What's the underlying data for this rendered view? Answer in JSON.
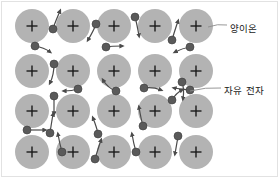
{
  "figure": {
    "title_visible": false,
    "background_color": "#ffffff",
    "border_color": "#e2e2e2",
    "width": 280,
    "height": 179
  },
  "colors": {
    "ion_fill": "#b3b3b3",
    "ion_plus": "#1a1a1a",
    "electron_fill": "#5a5a5a",
    "electron_stroke": "#3d3d3d",
    "arrow": "#4a4a4a",
    "leader_line": "#8c8c8c",
    "label_text": "#1a1a1a"
  },
  "labels": [
    {
      "id": "cation",
      "text": "양이온",
      "leader_from": [
        208,
        27
      ],
      "leader_to": [
        227,
        25
      ],
      "text_x": 230,
      "text_y": 21
    },
    {
      "id": "electron",
      "text": "자유 전자",
      "leader_from": [
        190,
        91
      ],
      "leader_to": [
        221,
        88
      ],
      "text_x": 224,
      "text_y": 83
    }
  ],
  "ion": {
    "symbol": "+",
    "radius": 17,
    "rows": 4,
    "cols": 5
  },
  "ions": [
    {
      "cx": 32,
      "cy": 26
    },
    {
      "cx": 73,
      "cy": 26
    },
    {
      "cx": 114,
      "cy": 26
    },
    {
      "cx": 155,
      "cy": 26
    },
    {
      "cx": 196,
      "cy": 26
    },
    {
      "cx": 32,
      "cy": 71
    },
    {
      "cx": 73,
      "cy": 71
    },
    {
      "cx": 114,
      "cy": 71
    },
    {
      "cx": 155,
      "cy": 71
    },
    {
      "cx": 196,
      "cy": 71
    },
    {
      "cx": 32,
      "cy": 111
    },
    {
      "cx": 73,
      "cy": 111
    },
    {
      "cx": 114,
      "cy": 111
    },
    {
      "cx": 155,
      "cy": 111
    },
    {
      "cx": 196,
      "cy": 111
    },
    {
      "cx": 32,
      "cy": 152
    },
    {
      "cx": 73,
      "cy": 152
    },
    {
      "cx": 114,
      "cy": 152
    },
    {
      "cx": 155,
      "cy": 152
    },
    {
      "cx": 196,
      "cy": 152
    }
  ],
  "electrons": [
    {
      "cx": 53,
      "cy": 29,
      "r": 4.0,
      "path": "M 53 29 C 55 22 58 16 60 11",
      "head": [
        60,
        11
      ]
    },
    {
      "cx": 96,
      "cy": 24,
      "r": 4.0,
      "path": "M 96 24 C 94 30 91 35 88 40",
      "head": [
        88,
        40
      ]
    },
    {
      "cx": 135,
      "cy": 17,
      "r": 4.0,
      "path": "M 135 17 C 137 24 138 30 139 36",
      "head": [
        139,
        36
      ]
    },
    {
      "cx": 172,
      "cy": 40,
      "r": 4.0,
      "path": "M 172 40 C 174 33 176 27 178 21",
      "head": [
        178,
        21
      ]
    },
    {
      "cx": 35,
      "cy": 46,
      "r": 4.0,
      "path": "M 35 46 C 41 47 46 49 50 52",
      "head": [
        50,
        52
      ]
    },
    {
      "cx": 106,
      "cy": 47,
      "r": 4.0,
      "path": "M 106 47 C 112 46 117 46 122 46",
      "head": [
        122,
        46
      ]
    },
    {
      "cx": 190,
      "cy": 47,
      "r": 4.0,
      "path": "M 190 47 C 184 48 179 50 175 52",
      "head": [
        175,
        52
      ]
    },
    {
      "cx": 54,
      "cy": 64,
      "r": 4.0,
      "path": "M 54 64 C 54 71 53 77 50 83",
      "head": [
        50,
        83
      ]
    },
    {
      "cx": 78,
      "cy": 89,
      "r": 4.0,
      "path": "M 78 89 C 72 91 68 91 64 91",
      "head": [
        64,
        91
      ]
    },
    {
      "cx": 116,
      "cy": 91,
      "r": 4.0,
      "path": "M 116 91 C 110 89 106 85 103 80",
      "head": [
        103,
        80
      ]
    },
    {
      "cx": 144,
      "cy": 88,
      "r": 4.0,
      "path": "M 144 88 C 150 87 156 88 161 90",
      "head": [
        161,
        90
      ]
    },
    {
      "cx": 190,
      "cy": 90,
      "r": 4.0,
      "path": "M 190 90 C 184 89 179 89 174 88",
      "head": [
        174,
        88
      ]
    },
    {
      "cx": 182,
      "cy": 82,
      "r": 4.0,
      "path": "M 182 82 C 184 88 184 93 183 99",
      "head": [
        183,
        99
      ]
    },
    {
      "cx": 54,
      "cy": 96,
      "r": 4.0,
      "path": "M 54 96 C 54 102 54 108 54 114",
      "head": [
        54,
        114
      ]
    },
    {
      "cx": 27,
      "cy": 130,
      "r": 4.0,
      "path": "M 27 130 C 33 130 39 130 45 130",
      "head": [
        45,
        130
      ]
    },
    {
      "cx": 50,
      "cy": 133,
      "r": 4.0,
      "path": "M 50 133 C 51 126 52 120 53 114",
      "head": [
        53,
        114
      ]
    },
    {
      "cx": 143,
      "cy": 126,
      "r": 4.0,
      "path": "M 143 126 C 141 119 140 113 139 107",
      "head": [
        139,
        107
      ]
    },
    {
      "cx": 172,
      "cy": 100,
      "r": 4.0,
      "path": "M 172 100 C 175 95 178 92 182 90",
      "head": [
        182,
        90
      ]
    },
    {
      "cx": 98,
      "cy": 134,
      "r": 4.0,
      "path": "M 98 134 C 97 128 95 123 93 118",
      "head": [
        93,
        118
      ]
    },
    {
      "cx": 62,
      "cy": 152,
      "r": 4.0,
      "path": "M 62 152 C 60 145 59 140 58 134",
      "head": [
        58,
        134
      ]
    },
    {
      "cx": 95,
      "cy": 159,
      "r": 4.0,
      "path": "M 95 159 C 97 152 99 146 101 140",
      "head": [
        101,
        140
      ]
    },
    {
      "cx": 136,
      "cy": 152,
      "r": 4.0,
      "path": "M 136 152 C 134 145 133 140 132 134",
      "head": [
        132,
        134
      ]
    },
    {
      "cx": 178,
      "cy": 136,
      "r": 4.0,
      "path": "M 178 136 C 177 143 176 148 175 154",
      "head": [
        175,
        154
      ]
    }
  ]
}
